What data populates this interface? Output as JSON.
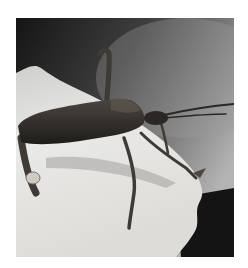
{
  "image": {
    "subject": "leaf-footed bug insect on white fabric",
    "alt": "Close-up photograph of a dark brown leaf-footed bug standing on a torn white surface",
    "colors": {
      "background_dark": "#1c1c1c",
      "background_mid": "#6e6e6e",
      "background_light": "#b8b8b8",
      "surface": "#e6e6e4",
      "insect_body": "#2e2b27",
      "insect_leg": "#4a4640"
    }
  }
}
